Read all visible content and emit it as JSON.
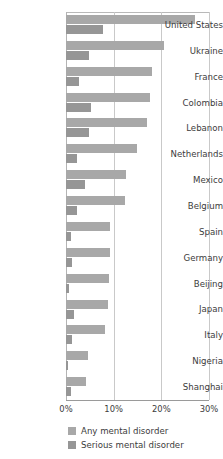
{
  "chart_data": {
    "type": "bar",
    "orientation": "horizontal",
    "title": "",
    "subtitle": "",
    "xlabel": "",
    "ylabel": "",
    "xlim": [
      0,
      30
    ],
    "xticks": [
      0,
      10,
      20,
      30
    ],
    "xtick_labels": [
      "0%",
      "10%",
      "20%",
      "30%"
    ],
    "grid": true,
    "legend_position": "bottom-left",
    "categories": [
      "United States",
      "Ukraine",
      "France",
      "Colombia",
      "Lebanon",
      "Netherlands",
      "Mexico",
      "Belgium",
      "Spain",
      "Germany",
      "Beijing",
      "Japan",
      "Italy",
      "Nigeria",
      "Shanghai"
    ],
    "series": [
      {
        "name": "Any mental disorder",
        "color": "#a8a8a8",
        "values": [
          27.0,
          20.5,
          18.0,
          17.6,
          17.0,
          14.9,
          12.5,
          12.3,
          9.2,
          9.3,
          9.1,
          8.8,
          8.2,
          4.7,
          4.3
        ]
      },
      {
        "name": "Serious mental disorder",
        "color": "#969696",
        "values": [
          7.7,
          4.8,
          2.7,
          5.2,
          4.9,
          2.3,
          3.9,
          2.4,
          1.0,
          1.2,
          0.7,
          1.6,
          1.2,
          0.4,
          1.1
        ]
      }
    ]
  },
  "legend": {
    "items": [
      {
        "label": "Any mental disorder",
        "color": "#a8a8a8"
      },
      {
        "label": "Serious mental disorder",
        "color": "#969696"
      }
    ]
  },
  "colors": {
    "any_mental_disorder": "#a8a8a8",
    "serious_mental_disorder": "#969696",
    "gridline": "#c9c9c9",
    "axis": "#9a9a9a",
    "text": "#3c3c3c",
    "background": "#ffffff"
  }
}
